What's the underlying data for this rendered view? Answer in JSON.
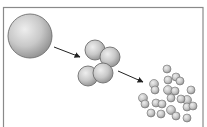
{
  "diagram": {
    "colors": {
      "frame": "#8a8a8a",
      "sphere_light": "#eeeeee",
      "sphere_mid": "#c8c8c8",
      "sphere_dark": "#8f8f8f",
      "outline": "#6e6e6e",
      "arrow": "#222222"
    },
    "frame": {
      "x": 3.5,
      "y": 7.5,
      "width": 199.5,
      "height": 125
    },
    "large_sphere": {
      "cx": 30,
      "cy": 36,
      "r": 22
    },
    "medium_spheres": [
      {
        "cx": 95,
        "cy": 50,
        "r": 10
      },
      {
        "cx": 110,
        "cy": 57,
        "r": 10
      },
      {
        "cx": 88,
        "cy": 76,
        "r": 10
      },
      {
        "cx": 103,
        "cy": 73,
        "r": 10
      }
    ],
    "small_spheres": [
      {
        "cx": 167,
        "cy": 69,
        "r": 4
      },
      {
        "cx": 176,
        "cy": 77,
        "r": 4
      },
      {
        "cx": 180,
        "cy": 81,
        "r": 4
      },
      {
        "cx": 168,
        "cy": 80,
        "r": 4
      },
      {
        "cx": 154,
        "cy": 84,
        "r": 4.5
      },
      {
        "cx": 155,
        "cy": 90,
        "r": 4
      },
      {
        "cx": 168,
        "cy": 90,
        "r": 4.5
      },
      {
        "cx": 175,
        "cy": 91,
        "r": 4
      },
      {
        "cx": 191,
        "cy": 90,
        "r": 4
      },
      {
        "cx": 171,
        "cy": 98,
        "r": 4
      },
      {
        "cx": 143,
        "cy": 98,
        "r": 4.5
      },
      {
        "cx": 145,
        "cy": 104,
        "r": 4
      },
      {
        "cx": 156,
        "cy": 103,
        "r": 4
      },
      {
        "cx": 162,
        "cy": 104,
        "r": 4
      },
      {
        "cx": 187,
        "cy": 100,
        "r": 4.5
      },
      {
        "cx": 187,
        "cy": 107,
        "r": 4
      },
      {
        "cx": 193,
        "cy": 106,
        "r": 4
      },
      {
        "cx": 171,
        "cy": 110,
        "r": 4.5
      },
      {
        "cx": 176,
        "cy": 116,
        "r": 4
      },
      {
        "cx": 151,
        "cy": 113,
        "r": 4
      },
      {
        "cx": 161,
        "cy": 114,
        "r": 4
      },
      {
        "cx": 187,
        "cy": 118,
        "r": 4
      },
      {
        "cx": 181,
        "cy": 99,
        "r": 4
      }
    ],
    "arrows": [
      {
        "x1": 54,
        "y1": 47,
        "x2": 80,
        "y2": 57
      },
      {
        "x1": 118,
        "y1": 71,
        "x2": 143,
        "y2": 82
      }
    ]
  }
}
